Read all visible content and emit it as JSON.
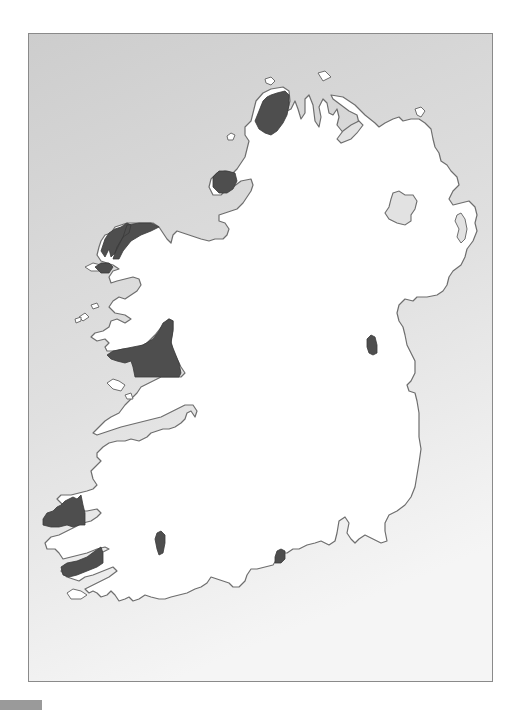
{
  "map": {
    "title": "Map of Ireland with shaded regions",
    "colors": {
      "sea_top": "#cfcfcf",
      "sea_bottom": "#f4f4f4",
      "land": "#ffffff",
      "coastline": "#6e6e6e",
      "shaded_region": "#4e4e4e",
      "lake": "#e2e2e2",
      "frame_border": "#8a8a8a",
      "corner_bar": "#9a9a9a"
    },
    "shaded_regions": [
      {
        "name": "North Donegal",
        "approx_center": [
          268,
          110
        ]
      },
      {
        "name": "West Donegal",
        "approx_center": [
          222,
          181
        ]
      },
      {
        "name": "North Mayo / Erris",
        "approx_center": [
          125,
          245
        ]
      },
      {
        "name": "Achill",
        "approx_center": [
          101,
          267
        ]
      },
      {
        "name": "Connemara / Galway",
        "approx_center": [
          145,
          350
        ]
      },
      {
        "name": "Dingle Peninsula",
        "approx_center": [
          63,
          514
        ]
      },
      {
        "name": "Iveragh Peninsula",
        "approx_center": [
          80,
          563
        ]
      },
      {
        "name": "Muskerry (Cork)",
        "approx_center": [
          158,
          543
        ]
      },
      {
        "name": "Ring (Waterford)",
        "approx_center": [
          279,
          557
        ]
      },
      {
        "name": "Meath",
        "approx_center": [
          372,
          343
        ]
      }
    ],
    "lakes": [
      {
        "name": "Lough Neagh",
        "approx_center": [
          402,
          210
        ]
      },
      {
        "name": "Lough Foyle",
        "approx_center": [
          347,
          128
        ]
      }
    ]
  },
  "corner_bar": {
    "label": ""
  }
}
